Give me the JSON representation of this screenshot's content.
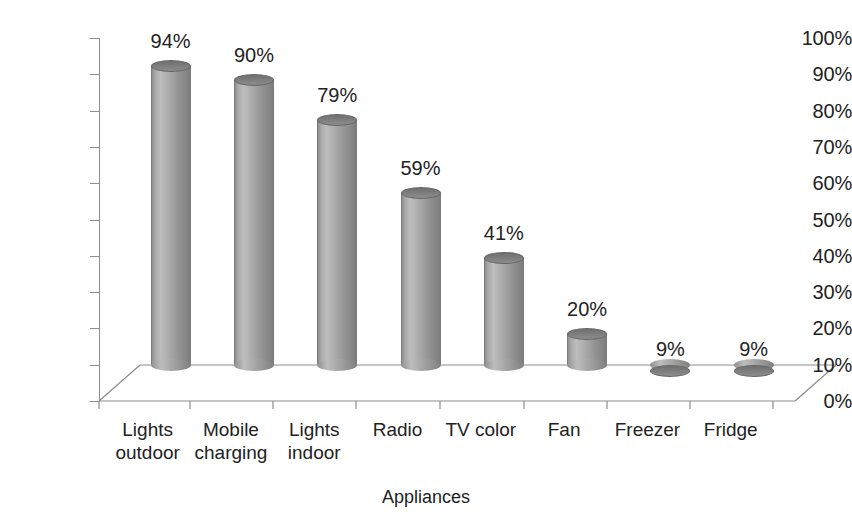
{
  "chart_data": {
    "type": "bar",
    "title": "",
    "subtitle": "",
    "xlabel": "Appliances",
    "ylabel": "",
    "categories": [
      "Lights\noutdoor",
      "Mobile\ncharging",
      "Lights\nindoor",
      "Radio",
      "TV color",
      "Fan",
      "Freezer",
      "Fridge"
    ],
    "values": [
      94,
      90,
      79,
      59,
      41,
      20,
      9,
      9
    ],
    "data_labels": [
      "94%",
      "90%",
      "79%",
      "59%",
      "41%",
      "20%",
      "9%",
      "9%"
    ],
    "ylim": [
      0,
      100
    ],
    "ytick_values": [
      0,
      10,
      20,
      30,
      40,
      50,
      60,
      70,
      80,
      90,
      100
    ],
    "ytick_labels": [
      "0%",
      "10%",
      "20%",
      "30%",
      "40%",
      "50%",
      "60%",
      "70%",
      "80%",
      "90%",
      "100%"
    ],
    "grid": false,
    "legend": null,
    "style": "3d-cylinder",
    "bar_color": "#9a9a9a",
    "axis_color": "#8c8c8c",
    "background": "#ffffff",
    "text_color": "#222222"
  },
  "axis": {
    "x_title": "Appliances"
  }
}
